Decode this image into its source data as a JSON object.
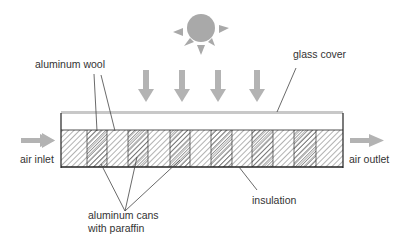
{
  "diagram": {
    "labels": {
      "aluminum_wool": "aluminum wool",
      "glass_cover": "glass cover",
      "air_inlet": "air inlet",
      "air_outlet": "air outlet",
      "insulation": "insulation",
      "cans_line1": "aluminum cans",
      "cans_line2": "with paraffin"
    },
    "icons": {
      "sun": "sun-icon",
      "radiation": "down-arrow-icon",
      "airflow": "right-arrow-icon"
    },
    "colors": {
      "arrow_gray": "#b3b3b3",
      "sun_gray": "#a9a9a9",
      "glass_gray": "#c8c8c8",
      "outline": "#222222",
      "hatch": "#555555"
    },
    "cell_dividers_x": [
      87,
      107,
      128,
      148,
      170,
      190,
      211,
      232,
      252,
      273,
      294,
      316
    ]
  }
}
